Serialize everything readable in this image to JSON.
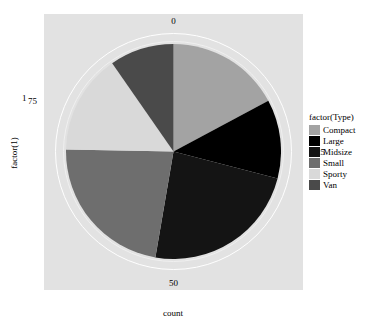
{
  "chart_data": {
    "type": "pie",
    "title": "",
    "xlabel": "count",
    "ylabel": "factor(1)",
    "legend_title": "factor(Type)",
    "legend_position": "right",
    "grid": true,
    "coord": "polar",
    "angular_ticks": [
      "0",
      "25",
      "50",
      "75"
    ],
    "angular_tick_values": [
      0,
      25,
      50,
      75
    ],
    "angular_max": 93,
    "radial_ticks": [
      "1"
    ],
    "categories": [
      "Compact",
      "Large",
      "Midsize",
      "Small",
      "Sporty",
      "Van"
    ],
    "values": [
      16,
      11,
      22,
      21,
      14,
      9
    ],
    "colors": [
      "#a3a3a3",
      "#000000",
      "#141414",
      "#6e6e6e",
      "#d9d9d9",
      "#4a4a4a"
    ],
    "slices": [
      {
        "label": "Compact",
        "value": 16,
        "start_deg": 0,
        "end_deg": 61.9,
        "color": "#a3a3a3"
      },
      {
        "label": "Large",
        "value": 11,
        "start_deg": 61.9,
        "end_deg": 104.5,
        "color": "#000000"
      },
      {
        "label": "Midsize",
        "value": 22,
        "start_deg": 104.5,
        "end_deg": 189.7,
        "color": "#141414"
      },
      {
        "label": "Small",
        "value": 21,
        "start_deg": 189.7,
        "end_deg": 271.0,
        "color": "#6e6e6e"
      },
      {
        "label": "Sporty",
        "value": 14,
        "start_deg": 271.0,
        "end_deg": 325.2,
        "color": "#d9d9d9"
      },
      {
        "label": "Van",
        "value": 9,
        "start_deg": 325.2,
        "end_deg": 360.0,
        "color": "#4a4a4a"
      }
    ]
  },
  "axes": {
    "x_title": "count",
    "y_title": "factor(1)",
    "tick_0": "0",
    "tick_25": "25",
    "tick_50": "50",
    "tick_75": "75",
    "y_tick_1": "1"
  },
  "legend": {
    "title": "factor(Type)",
    "items": [
      {
        "label": "Compact",
        "color": "#a3a3a3"
      },
      {
        "label": "Large",
        "color": "#000000"
      },
      {
        "label": "Midsize",
        "color": "#141414"
      },
      {
        "label": "Small",
        "color": "#6e6e6e"
      },
      {
        "label": "Sporty",
        "color": "#d9d9d9"
      },
      {
        "label": "Van",
        "color": "#4a4a4a"
      }
    ]
  },
  "theme": {
    "panel_background": "#e2e2e2",
    "plot_background": "#ffffff",
    "grid_color": "#ffffff",
    "text_color": "#000000"
  }
}
